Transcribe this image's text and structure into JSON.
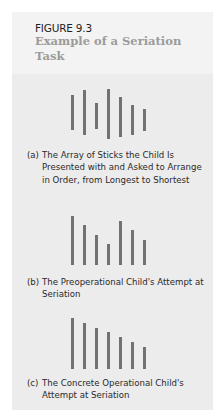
{
  "figure": {
    "label": "FIGURE 9.3",
    "title": "Example of a Seriation Task"
  },
  "panels": [
    {
      "tag": "(a)",
      "caption": "The Array of Sticks the Child Is Presented with and Asked to Arrange in Order, from Longest to Shortest",
      "sticks": [
        {
          "x": 71,
          "top": 95,
          "bottom": 130
        },
        {
          "x": 83,
          "top": 90,
          "bottom": 135
        },
        {
          "x": 95,
          "top": 103,
          "bottom": 129
        },
        {
          "x": 107,
          "top": 89,
          "bottom": 139
        },
        {
          "x": 119,
          "top": 97,
          "bottom": 137
        },
        {
          "x": 131,
          "top": 105,
          "bottom": 135
        },
        {
          "x": 143,
          "top": 109,
          "bottom": 131
        }
      ]
    },
    {
      "tag": "(b)",
      "caption": "The Preoperational Child's Attempt at Seriation",
      "sticks": [
        {
          "x": 71,
          "top": 216,
          "bottom": 265
        },
        {
          "x": 83,
          "top": 225,
          "bottom": 265
        },
        {
          "x": 95,
          "top": 235,
          "bottom": 265
        },
        {
          "x": 107,
          "top": 244,
          "bottom": 265
        },
        {
          "x": 119,
          "top": 221,
          "bottom": 265
        },
        {
          "x": 131,
          "top": 230,
          "bottom": 265
        },
        {
          "x": 143,
          "top": 240,
          "bottom": 265
        }
      ]
    },
    {
      "tag": "(c)",
      "caption": "The Concrete Operational Child's Attempt at Seriation",
      "sticks": [
        {
          "x": 71,
          "top": 318,
          "bottom": 369
        },
        {
          "x": 83,
          "top": 323,
          "bottom": 369
        },
        {
          "x": 95,
          "top": 328,
          "bottom": 369
        },
        {
          "x": 107,
          "top": 332,
          "bottom": 369
        },
        {
          "x": 119,
          "top": 337,
          "bottom": 369
        },
        {
          "x": 131,
          "top": 342,
          "bottom": 369
        },
        {
          "x": 143,
          "top": 347,
          "bottom": 369
        }
      ]
    }
  ],
  "colors": {
    "panel_bg": "#ececec",
    "header_bg": "#f3f3f3",
    "title": "#9b9b9b",
    "stick": "#727272",
    "text": "#2a2a2a"
  }
}
